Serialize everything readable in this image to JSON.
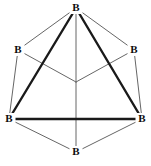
{
  "figure": {
    "type": "chemical-structure-diagram",
    "width": 151,
    "height": 166,
    "background_color": "#ffffff",
    "bond_colors": {
      "thin": "#666666",
      "thick": "#1a1a1a"
    },
    "atoms": [
      {
        "id": "b-top",
        "label": "B",
        "x": 76,
        "y": 8
      },
      {
        "id": "b-upper-left",
        "label": "B",
        "x": 18,
        "y": 50
      },
      {
        "id": "b-upper-right",
        "label": "B",
        "x": 134,
        "y": 50
      },
      {
        "id": "b-lower-left",
        "label": "B",
        "x": 9,
        "y": 119
      },
      {
        "id": "b-lower-right",
        "label": "B",
        "x": 142,
        "y": 119
      },
      {
        "id": "b-bottom",
        "label": "B",
        "x": 76,
        "y": 152
      },
      {
        "id": "b-center",
        "label": "",
        "x": 76,
        "y": 82
      }
    ],
    "bonds_thin": [
      {
        "from": "b-top",
        "to": "b-upper-left"
      },
      {
        "from": "b-top",
        "to": "b-upper-right"
      },
      {
        "from": "b-upper-left",
        "to": "b-lower-left"
      },
      {
        "from": "b-upper-right",
        "to": "b-lower-right"
      },
      {
        "from": "b-lower-left",
        "to": "b-bottom"
      },
      {
        "from": "b-lower-right",
        "to": "b-bottom"
      },
      {
        "from": "b-center",
        "to": "b-upper-left"
      },
      {
        "from": "b-center",
        "to": "b-upper-right"
      },
      {
        "from": "b-center",
        "to": "b-bottom"
      },
      {
        "from": "b-top",
        "to": "b-center"
      }
    ],
    "bonds_thick": [
      {
        "from": "b-top",
        "to": "b-lower-left"
      },
      {
        "from": "b-top",
        "to": "b-lower-right"
      },
      {
        "from": "b-lower-left",
        "to": "b-lower-right"
      }
    ]
  }
}
